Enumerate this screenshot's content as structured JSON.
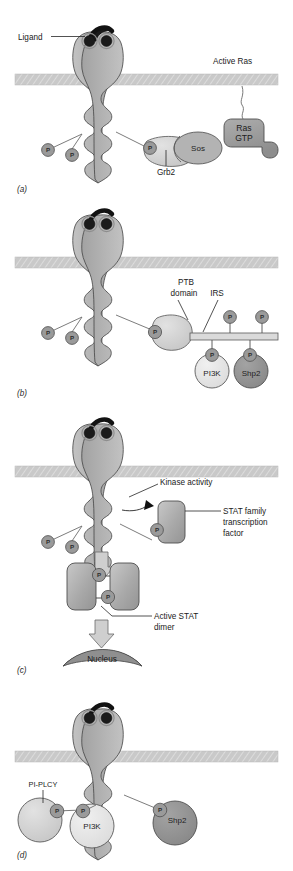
{
  "figure": {
    "panels": [
      {
        "id": "a",
        "letter": "(a)",
        "labels": [
          {
            "name": "ligand",
            "text": "Ligand"
          },
          {
            "name": "active-ras",
            "text": "Active Ras"
          },
          {
            "name": "grb2",
            "text": "Grb2"
          }
        ],
        "molecules": [
          {
            "name": "ras-gtp",
            "line1": "Ras",
            "line2": "GTP",
            "color": "#9b9b9b"
          },
          {
            "name": "sos",
            "text": "Sos",
            "color": "#b5b5b5"
          }
        ],
        "phosphates": 3,
        "phosphate_glyph": "P"
      },
      {
        "id": "b",
        "letter": "(b)",
        "labels": [
          {
            "name": "ptb-domain",
            "line1": "PTB",
            "line2": "domain"
          },
          {
            "name": "irs",
            "text": "IRS"
          }
        ],
        "molecules": [
          {
            "name": "pi3k",
            "text": "PI3K",
            "color": "#e0e0e0"
          },
          {
            "name": "shp2",
            "text": "Shp2",
            "color": "#8f8f8f"
          }
        ],
        "phosphates": 7,
        "phosphate_glyph": "P"
      },
      {
        "id": "c",
        "letter": "(c)",
        "labels": [
          {
            "name": "kinase-activity",
            "text": "Kinase activity"
          },
          {
            "name": "stat-family",
            "line1": "STAT family",
            "line2": "transcription",
            "line3": "factor"
          },
          {
            "name": "active-stat-dimer",
            "line1": "Active STAT",
            "line2": "dimer"
          },
          {
            "name": "nucleus",
            "text": "Nucleus"
          }
        ],
        "phosphates": 5,
        "phosphate_glyph": "P"
      },
      {
        "id": "d",
        "letter": "(d)",
        "labels": [
          {
            "name": "pi-plc-gamma",
            "text": "PI-PLCY"
          }
        ],
        "molecules": [
          {
            "name": "pi3k",
            "text": "PI3K",
            "color": "#e6e6e6"
          },
          {
            "name": "shp2",
            "text": "Shp2",
            "color": "#8f8f8f"
          }
        ],
        "phosphates": 3,
        "phosphate_glyph": "P"
      }
    ],
    "colors": {
      "receptor": "#b2b2b2",
      "membrane": "#c6c6c6",
      "phosphate": "#9a9a9a",
      "ligand": "#1b1b1b",
      "background": "#ffffff",
      "text": "#1a1a1a"
    }
  }
}
